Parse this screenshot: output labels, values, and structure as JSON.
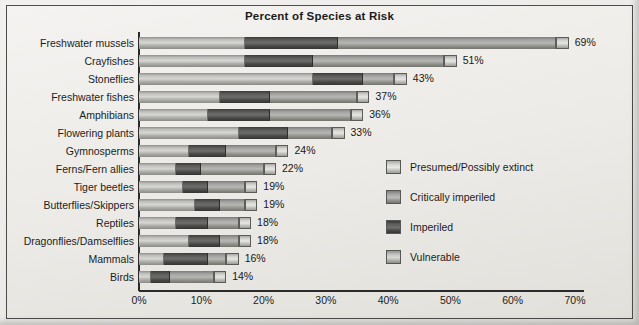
{
  "chart": {
    "title": "Percent of Species at Risk"
  },
  "axis": {
    "ticks": [
      "0%",
      "10%",
      "20%",
      "30%",
      "40%",
      "50%",
      "60%",
      "70%"
    ],
    "min": 0,
    "max": 70
  },
  "legend": {
    "items": [
      {
        "label": "Presumed/Possibly extinct",
        "swatch": "extinct"
      },
      {
        "label": "Critically imperiled",
        "swatch": "critical"
      },
      {
        "label": "Imperiled",
        "swatch": "imperiled"
      },
      {
        "label": "Vulnerable",
        "swatch": "vulnerable"
      }
    ]
  },
  "chart_data": {
    "type": "bar",
    "orientation": "horizontal",
    "stacked": true,
    "title": "Percent of Species at Risk",
    "xlabel": "",
    "ylabel": "",
    "xlim": [
      0,
      70
    ],
    "grid": false,
    "legend_position": "right-middle",
    "categories": [
      "Freshwater mussels",
      "Crayfishes",
      "Stoneflies",
      "Freshwater fishes",
      "Amphibians",
      "Flowering plants",
      "Gymnosperms",
      "Ferns/Fern allies",
      "Tiger beetles",
      "Butterflies/Skippers",
      "Reptiles",
      "Dragonflies/Damselflies",
      "Mammals",
      "Birds"
    ],
    "series": [
      {
        "name": "Vulnerable",
        "values": [
          17,
          17,
          28,
          13,
          11,
          16,
          8,
          6,
          7,
          9,
          6,
          8,
          4,
          2
        ]
      },
      {
        "name": "Imperiled",
        "values": [
          15,
          11,
          8,
          8,
          10,
          8,
          6,
          4,
          4,
          4,
          5,
          5,
          7,
          3
        ]
      },
      {
        "name": "Critically imperiled",
        "values": [
          35,
          21,
          5,
          14,
          13,
          7,
          8,
          10,
          6,
          4,
          5,
          3,
          3,
          7
        ]
      },
      {
        "name": "Presumed/Possibly extinct",
        "values": [
          2,
          2,
          2,
          2,
          2,
          2,
          2,
          2,
          2,
          2,
          2,
          2,
          2,
          2
        ]
      }
    ],
    "totals": [
      69,
      51,
      43,
      37,
      36,
      33,
      24,
      22,
      19,
      19,
      18,
      18,
      16,
      14
    ],
    "value_labels": [
      "69%",
      "51%",
      "43%",
      "37%",
      "36%",
      "33%",
      "24%",
      "22%",
      "19%",
      "19%",
      "18%",
      "18%",
      "16%",
      "14%"
    ]
  }
}
